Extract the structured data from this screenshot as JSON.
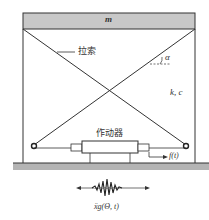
{
  "diagram": {
    "mass_label": "m",
    "cable_label": "拉索",
    "angle_label": "α",
    "stiffness_damping_label": "k, c",
    "actuator_label": "作动器",
    "force_label": "f(t)",
    "ground_excitation_label": "ẍg(Θ, t)"
  },
  "colors": {
    "mass_fill": "#c8c8c8",
    "ground_fill": "#b4b4b4",
    "line": "#333333"
  }
}
